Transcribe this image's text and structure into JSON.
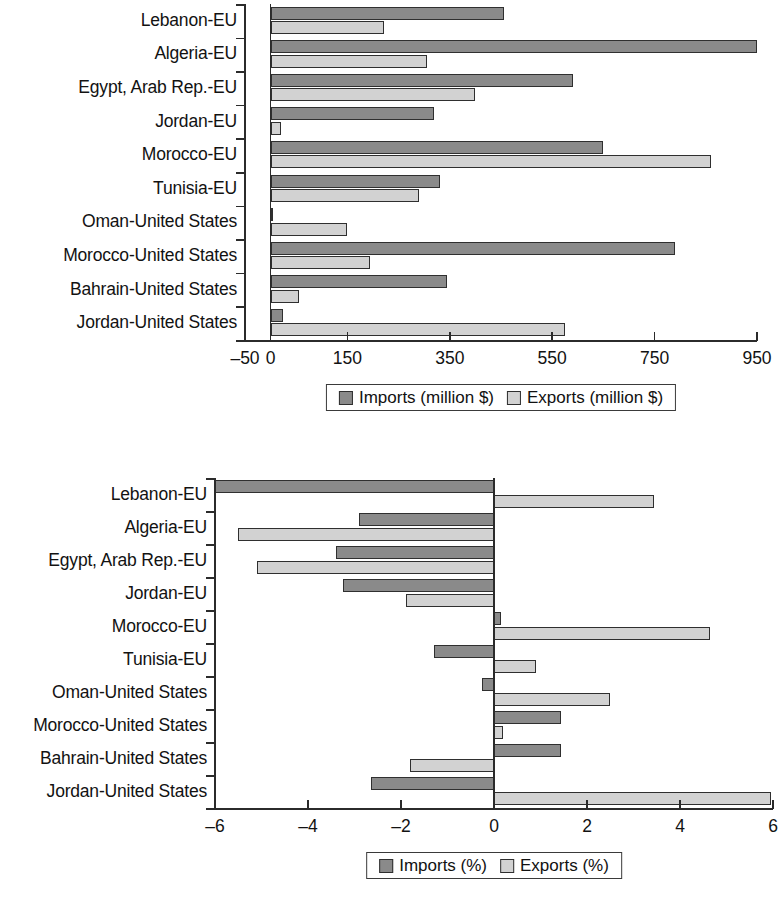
{
  "chart_data": [
    {
      "id": "trade-values",
      "type": "bar",
      "orientation": "horizontal",
      "title": "",
      "xlabel": "",
      "ylabel": "",
      "grid": false,
      "legend_position": "bottom",
      "xlim": [
        -50,
        950
      ],
      "xticks": [
        -50,
        0,
        150,
        350,
        550,
        750,
        950
      ],
      "xtick_labels": [
        "–50",
        "0",
        "150",
        "350",
        "550",
        "750",
        "950"
      ],
      "categories": [
        "Lebanon-EU",
        "Algeria-EU",
        "Egypt, Arab Rep.-EU",
        "Jordan-EU",
        "Morocco-EU",
        "Tunisia-EU",
        "Oman-United States",
        "Morocco-United States",
        "Bahrain-United States",
        "Jordan-United States"
      ],
      "series": [
        {
          "name": "Imports (million $)",
          "color": "#8a8a8a",
          "values": [
            456,
            950,
            590,
            320,
            650,
            330,
            5,
            790,
            345,
            25
          ]
        },
        {
          "name": "Exports (million $)",
          "color": "#d2d2d2",
          "values": [
            221,
            305,
            400,
            20,
            860,
            290,
            150,
            195,
            55,
            575
          ]
        }
      ],
      "legend": [
        "Imports (million $)",
        "Exports (million $)"
      ]
    },
    {
      "id": "trade-shares",
      "type": "bar",
      "orientation": "horizontal",
      "title": "",
      "xlabel": "",
      "ylabel": "",
      "grid": false,
      "legend_position": "bottom",
      "xlim": [
        -6,
        6
      ],
      "xticks": [
        -6,
        -4,
        -2,
        0,
        2,
        4,
        6
      ],
      "xtick_labels": [
        "–6",
        "–4",
        "–2",
        "0",
        "2",
        "4",
        "6"
      ],
      "categories": [
        "Lebanon-EU",
        "Algeria-EU",
        "Egypt, Arab Rep.-EU",
        "Jordan-EU",
        "Morocco-EU",
        "Tunisia-EU",
        "Oman-United States",
        "Morocco-United States",
        "Bahrain-United States",
        "Jordan-United States"
      ],
      "series": [
        {
          "name": "Imports (%)",
          "color": "#8a8a8a",
          "values": [
            -6.0,
            -2.9,
            -3.4,
            -3.25,
            0.15,
            -1.3,
            -0.25,
            1.45,
            1.45,
            -2.65
          ]
        },
        {
          "name": "Exports (%)",
          "color": "#d2d2d2",
          "values": [
            3.45,
            -5.5,
            -5.1,
            -1.9,
            4.65,
            0.9,
            2.5,
            0.2,
            -1.8,
            5.95
          ]
        }
      ],
      "legend": [
        "Imports (%)",
        "Exports (%)"
      ]
    }
  ],
  "colors": {
    "imports": "#8a8a8a",
    "exports": "#d2d2d2",
    "axis": "#2b2b2b",
    "text": "#121212",
    "background": "#ffffff"
  }
}
